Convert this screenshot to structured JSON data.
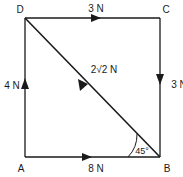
{
  "diagram": {
    "type": "force-vector-square",
    "vertices": [
      {
        "id": "A",
        "label": "A",
        "x": 25,
        "y": 157
      },
      {
        "id": "B",
        "label": "B",
        "x": 160,
        "y": 157
      },
      {
        "id": "C",
        "label": "C",
        "x": 160,
        "y": 18
      },
      {
        "id": "D",
        "label": "D",
        "x": 25,
        "y": 18
      }
    ],
    "forces": [
      {
        "id": "force-ab",
        "label": "8 N",
        "magnitude": 8,
        "unit": "N",
        "from": "A",
        "to": "B",
        "direction": "right",
        "edge": "bottom"
      },
      {
        "id": "force-cb",
        "label": "3 N",
        "magnitude": 3,
        "unit": "N",
        "from": "C",
        "to": "B",
        "direction": "down",
        "edge": "right"
      },
      {
        "id": "force-dc",
        "label": "3 N",
        "magnitude": 3,
        "unit": "N",
        "from": "D",
        "to": "C",
        "direction": "right",
        "edge": "top"
      },
      {
        "id": "force-ad",
        "label": "4 N",
        "magnitude": 4,
        "unit": "N",
        "from": "A",
        "to": "D",
        "direction": "up",
        "edge": "left"
      },
      {
        "id": "force-db",
        "label": "2√2 N",
        "magnitude": 2.828,
        "unit": "N",
        "from": "D",
        "to": "B",
        "direction": "down-right",
        "edge": "diagonal"
      }
    ],
    "angle": {
      "id": "angle-at-b",
      "label": "45°",
      "value": 45,
      "unit": "degrees",
      "at_vertex": "B",
      "between": [
        "AB",
        "BD"
      ]
    },
    "colors": {
      "ink": "#1a1a1a",
      "background": "#ffffff"
    }
  }
}
